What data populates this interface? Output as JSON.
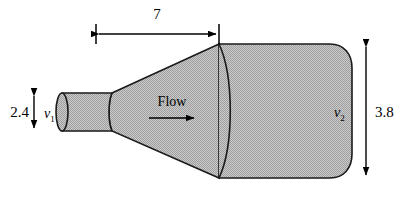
{
  "figure": {
    "background_color": "#ffffff",
    "body_fill_color": "#b9b9b9",
    "outline_color": "#1a1a1a",
    "dimension_color": "#000000",
    "dimensions": {
      "length": {
        "label": "7",
        "orientation": "horizontal",
        "position": "top"
      },
      "inlet_diameter": {
        "label": "2.4",
        "orientation": "vertical",
        "position": "left"
      },
      "outlet_diameter": {
        "label": "3.8",
        "orientation": "vertical",
        "position": "right"
      }
    },
    "labels": {
      "inlet_velocity": {
        "symbol": "v",
        "subscript": "1"
      },
      "outlet_velocity": {
        "symbol": "v",
        "subscript": "2"
      },
      "flow": "Flow"
    },
    "icons": {
      "flow_arrow": "arrow-right-icon",
      "length_arrow_left": "arrow-left-icon",
      "length_arrow_right": "arrow-right-icon",
      "inlet_arrow_up": "arrow-up-icon",
      "inlet_arrow_down": "arrow-down-icon",
      "outlet_arrow_up": "arrow-up-icon",
      "outlet_arrow_down": "arrow-down-icon"
    }
  }
}
